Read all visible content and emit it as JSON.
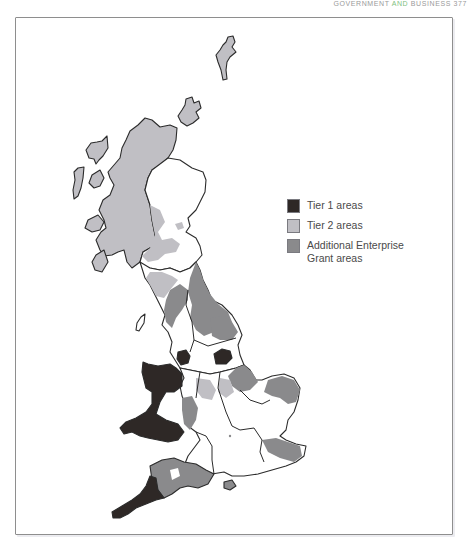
{
  "running_head": {
    "part1": "GOVERNMENT",
    "part2": "AND",
    "part3": "BUSINESS",
    "page_number": "377"
  },
  "map": {
    "subject": "Great Britain assisted areas",
    "colors": {
      "tier1": "#2e2826",
      "tier2": "#c0bfc4",
      "additional": "#8a8a8c",
      "land": "#ffffff",
      "outline": "#2b2b2b"
    }
  },
  "legend": {
    "items": [
      {
        "label": "Tier 1 areas",
        "color": "#2e2826"
      },
      {
        "label": "Tier 2 areas",
        "color": "#c0bfc4"
      },
      {
        "label": "Additional Enterprise Grant areas",
        "color": "#8a8a8c"
      }
    ]
  }
}
